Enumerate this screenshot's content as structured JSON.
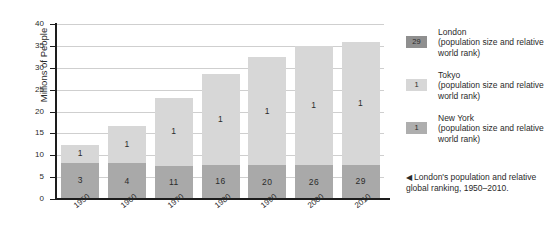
{
  "chart_data": {
    "type": "bar",
    "stacked": true,
    "title": "",
    "xlabel": "",
    "ylabel": "Millions of People",
    "ylim": [
      0,
      40
    ],
    "yticks": [
      0,
      5,
      10,
      15,
      20,
      25,
      30,
      35,
      40
    ],
    "ytick_labels": [
      "0",
      "5",
      "10",
      "15",
      "20",
      "25",
      "30",
      "35",
      "40"
    ],
    "grid": true,
    "categories": [
      "1950",
      "1960",
      "1970",
      "1980",
      "1990",
      "2000",
      "2010"
    ],
    "series": [
      {
        "name": "London",
        "color": "#a9a9a9",
        "values": [
          8.3,
          8.2,
          7.6,
          7.8,
          7.7,
          7.7,
          7.8
        ],
        "point_labels": [
          "3",
          "4",
          "11",
          "16",
          "20",
          "26",
          "29"
        ],
        "label_meaning": "relative world rank"
      },
      {
        "name": "Tokyo",
        "color": "#d7d7d7",
        "values": [
          4.0,
          8.4,
          15.6,
          20.7,
          24.8,
          27.2,
          28.2
        ],
        "point_labels": [
          "1",
          "1",
          "1",
          "1",
          "1",
          "1",
          "1"
        ],
        "label_meaning": "relative world rank"
      }
    ],
    "totals": [
      12.3,
      16.6,
      23.2,
      28.5,
      32.5,
      34.9,
      36.0
    ],
    "legend_position": "right",
    "annotations": []
  },
  "legend": {
    "items": [
      {
        "swatch_label": "29",
        "swatch_color": "#8f8f8f",
        "name": "London",
        "description": "(population size and relative world rank)"
      },
      {
        "swatch_label": "1",
        "swatch_color": "#d7d7d7",
        "name": "Tokyo",
        "description": "(population size and relative world rank)"
      },
      {
        "swatch_label": "1",
        "swatch_color": "#aeaeae",
        "name": "New York",
        "description": "(population size and relative world rank)"
      }
    ]
  },
  "caption": {
    "arrow": "◀",
    "text": "London's population and relative global ranking, 1950–2010."
  },
  "colors": {
    "bar_lower": "#a9a9a9",
    "bar_upper": "#d7d7d7",
    "axis": "#1d1d1d",
    "gridline": "#cfcfcf",
    "background": "#ffffff",
    "text": "#2a2a2a"
  }
}
